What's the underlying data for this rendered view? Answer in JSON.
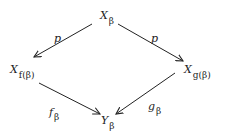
{
  "diagram": {
    "type": "commutative-diagram",
    "nodes": {
      "top": {
        "main": "X",
        "sub": "β"
      },
      "left": {
        "main": "X",
        "sub": "f(β)"
      },
      "right": {
        "main": "X",
        "sub": "g(β)"
      },
      "bottom": {
        "main": "Y",
        "sub": "β"
      }
    },
    "arrows": {
      "top_left": {
        "from": "X_β",
        "to": "X_f(β)",
        "label": "p",
        "label_sub": ""
      },
      "top_right": {
        "from": "X_β",
        "to": "X_g(β)",
        "label": "p",
        "label_sub": ""
      },
      "left_bottom": {
        "from": "X_f(β)",
        "to": "Y_β",
        "label": "f",
        "label_sub": "β"
      },
      "right_bottom": {
        "from": "X_g(β)",
        "to": "Y_β",
        "label": "g",
        "label_sub": "β"
      }
    },
    "colors": {
      "ink": "#222222",
      "background": "#ffffff"
    }
  }
}
